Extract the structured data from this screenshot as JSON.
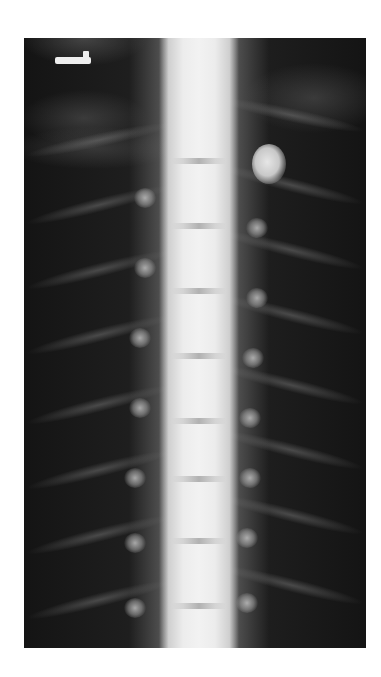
{
  "image": {
    "type": "radiograph",
    "subject": "thoracic spine, frontal view",
    "background_color": "#ffffff",
    "film_color": "#141414",
    "bone_color": "#f2f2f2"
  },
  "marker": {
    "label": "",
    "shape": "L-shaped orientation marker"
  }
}
